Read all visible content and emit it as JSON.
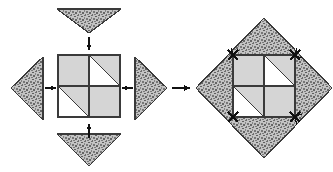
{
  "figure": {
    "canvas": {
      "width": 333,
      "height": 172
    },
    "colors": {
      "background": "#ffffff",
      "quadrant_fill": "#d5d5d5",
      "quadrant_white": "#ffffff",
      "stipple_base": "#bdbdbd",
      "stipple_dot": "#6a6a6a",
      "outline": "#3a3a3a",
      "arrow": "#111111"
    },
    "panels": [
      {
        "name": "exploded-panel",
        "label": "exploded view",
        "center": {
          "x": 89,
          "y": 88
        },
        "inner_square": {
          "name": "inner-square",
          "x": 58,
          "y": 55,
          "size": 62,
          "quadrants": [
            {
              "name": "quadrant-top-left",
              "position": "top-left",
              "pattern": "solid",
              "fill": "gray"
            },
            {
              "name": "quadrant-top-right",
              "position": "top-right",
              "pattern": "diagonal",
              "diagonal": "tl-br",
              "upper_right": "gray",
              "lower_left": "white"
            },
            {
              "name": "quadrant-bottom-left",
              "position": "bottom-left",
              "pattern": "diagonal",
              "diagonal": "tl-br",
              "upper_right": "gray",
              "lower_left": "white"
            },
            {
              "name": "quadrant-bottom-right",
              "position": "bottom-right",
              "pattern": "solid",
              "fill": "gray"
            }
          ]
        },
        "triangles": [
          {
            "name": "triangle-top",
            "points_toward": "down",
            "apex": {
              "x": 89,
              "y": 33
            },
            "base_left": {
              "x": 57,
              "y": 9
            },
            "base_right": {
              "x": 121,
              "y": 9
            },
            "texture": "stipple"
          },
          {
            "name": "triangle-bottom",
            "points_toward": "down",
            "apex": {
              "x": 89,
              "y": 166
            },
            "base_left": {
              "x": 57,
              "y": 134
            },
            "base_right": {
              "x": 121,
              "y": 134
            },
            "texture": "stipple"
          },
          {
            "name": "triangle-left",
            "points_toward": "left",
            "apex": {
              "x": 11,
              "y": 88
            },
            "base_top": {
              "x": 43,
              "y": 57
            },
            "base_bottom": {
              "x": 43,
              "y": 120
            },
            "texture": "stipple"
          },
          {
            "name": "triangle-right",
            "points_toward": "right",
            "apex": {
              "x": 167,
              "y": 88
            },
            "base_top": {
              "x": 135,
              "y": 57
            },
            "base_bottom": {
              "x": 135,
              "y": 120
            },
            "texture": "stipple"
          }
        ],
        "assembly_arrows": [
          {
            "name": "assembly-arrow-down",
            "direction": "down",
            "x": 89,
            "y": 44
          },
          {
            "name": "assembly-arrow-up",
            "direction": "up",
            "x": 89,
            "y": 131
          },
          {
            "name": "assembly-arrow-right",
            "direction": "right",
            "x": 50,
            "y": 88
          },
          {
            "name": "assembly-arrow-left",
            "direction": "left",
            "x": 128,
            "y": 88
          }
        ]
      },
      {
        "name": "assembled-panel",
        "label": "assembled diamond",
        "center": {
          "x": 264,
          "y": 88
        },
        "diamond": {
          "name": "outer-diamond",
          "top": {
            "x": 264,
            "y": 18
          },
          "right": {
            "x": 332,
            "y": 88
          },
          "bottom": {
            "x": 264,
            "y": 158
          },
          "left": {
            "x": 196,
            "y": 88
          },
          "texture": "stipple"
        },
        "inner_square": {
          "name": "inner-square",
          "x": 233,
          "y": 55,
          "size": 62,
          "quadrants": [
            {
              "name": "quadrant-top-left",
              "position": "top-left",
              "pattern": "solid",
              "fill": "gray"
            },
            {
              "name": "quadrant-top-right",
              "position": "top-right",
              "pattern": "diagonal",
              "diagonal": "tl-br",
              "upper_right": "gray",
              "lower_left": "white"
            },
            {
              "name": "quadrant-bottom-left",
              "position": "bottom-left",
              "pattern": "diagonal",
              "diagonal": "tl-br",
              "upper_right": "gray",
              "lower_left": "white"
            },
            {
              "name": "quadrant-bottom-right",
              "position": "bottom-right",
              "pattern": "solid",
              "fill": "gray"
            }
          ]
        },
        "seam_marks": [
          {
            "name": "seam-mark-top-left",
            "x": 233,
            "y": 55
          },
          {
            "name": "seam-mark-top-right",
            "x": 295,
            "y": 55
          },
          {
            "name": "seam-mark-bottom-left",
            "x": 233,
            "y": 117
          },
          {
            "name": "seam-mark-bottom-right",
            "x": 295,
            "y": 117
          }
        ]
      }
    ],
    "transition_arrow": {
      "name": "transition-arrow",
      "direction": "right",
      "x": 172,
      "y": 88,
      "length": 18
    }
  }
}
